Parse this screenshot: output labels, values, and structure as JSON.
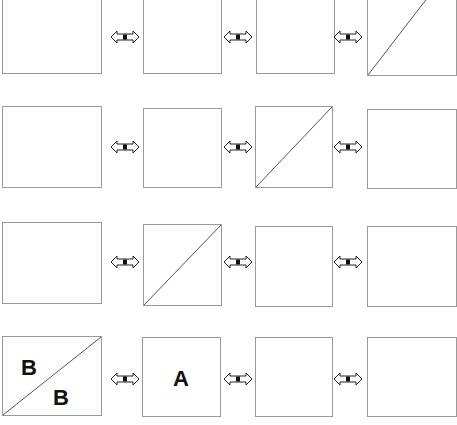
{
  "grid": {
    "rows": 4,
    "columns": 4,
    "connector_icon": "double-headed-arrow",
    "boxes": [
      {
        "row": 1,
        "col": 1,
        "diagonal": false,
        "labels": []
      },
      {
        "row": 1,
        "col": 2,
        "diagonal": false,
        "labels": []
      },
      {
        "row": 1,
        "col": 3,
        "diagonal": false,
        "labels": []
      },
      {
        "row": 1,
        "col": 4,
        "diagonal": true,
        "labels": []
      },
      {
        "row": 2,
        "col": 1,
        "diagonal": false,
        "labels": []
      },
      {
        "row": 2,
        "col": 2,
        "diagonal": false,
        "labels": []
      },
      {
        "row": 2,
        "col": 3,
        "diagonal": true,
        "labels": []
      },
      {
        "row": 2,
        "col": 4,
        "diagonal": false,
        "labels": []
      },
      {
        "row": 3,
        "col": 1,
        "diagonal": false,
        "labels": []
      },
      {
        "row": 3,
        "col": 2,
        "diagonal": true,
        "labels": []
      },
      {
        "row": 3,
        "col": 3,
        "diagonal": false,
        "labels": []
      },
      {
        "row": 3,
        "col": 4,
        "diagonal": false,
        "labels": []
      },
      {
        "row": 4,
        "col": 1,
        "diagonal": true,
        "labels": [
          "B",
          "B"
        ]
      },
      {
        "row": 4,
        "col": 2,
        "diagonal": false,
        "labels": [
          "A"
        ]
      },
      {
        "row": 4,
        "col": 3,
        "diagonal": false,
        "labels": []
      },
      {
        "row": 4,
        "col": 4,
        "diagonal": false,
        "labels": []
      }
    ]
  },
  "labels": {
    "r4c1_upper": "B",
    "r4c1_lower": "B",
    "r4c2_center": "A"
  }
}
